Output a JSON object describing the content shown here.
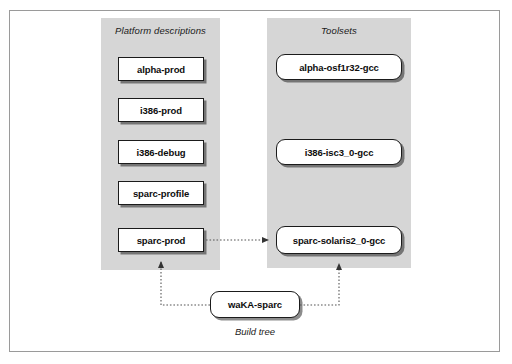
{
  "figure": {
    "caption": "Build tree",
    "columns": [
      {
        "id": "platform-descriptions",
        "title": "Platform descriptions",
        "nodes": [
          {
            "label": "alpha-prod"
          },
          {
            "label": "i386-prod"
          },
          {
            "label": "i386-debug"
          },
          {
            "label": "sparc-profile"
          },
          {
            "label": "sparc-prod"
          }
        ]
      },
      {
        "id": "toolsets",
        "title": "Toolsets",
        "nodes": [
          {
            "label": "alpha-osf1r32-gcc"
          },
          {
            "label": "i386-isc3_0-gcc"
          },
          {
            "label": "sparc-solaris2_0-gcc"
          }
        ]
      }
    ],
    "build_node": {
      "label": "waKA-sparc"
    },
    "colors": {
      "panel_background": "#d6d6d6",
      "node_fill": "#ffffff",
      "node_border": "#1b1b1b",
      "edge": "#555555",
      "frame_border": "#9a9a9a",
      "page_background": "#ffffff"
    },
    "edges": [
      {
        "from": "sparc-prod",
        "to": "sparc-solaris2_0-gcc",
        "style": "dotted",
        "arrow": "single"
      },
      {
        "from": "waKA-sparc",
        "to": "sparc-prod",
        "style": "dotted",
        "arrow": "single"
      },
      {
        "from": "waKA-sparc",
        "to": "sparc-solaris2_0-gcc",
        "style": "dotted",
        "arrow": "single"
      }
    ]
  }
}
